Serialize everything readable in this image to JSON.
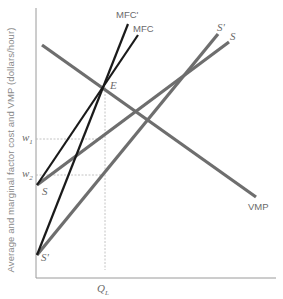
{
  "diagram": {
    "title": "",
    "y_axis_label": "Average and marginal factor cost and VMP (dollars/hour)",
    "x_axis_label": "",
    "x_ticks": [
      {
        "label": "Q",
        "subscript": "L"
      }
    ],
    "y_ticks": [
      {
        "label": "w",
        "subscript": "1"
      },
      {
        "label": "w",
        "subscript": "2"
      }
    ],
    "curves": [
      {
        "name": "VMP",
        "label": "VMP",
        "color": "#6e6e6e",
        "from": [
          42,
          45
        ],
        "to": [
          256,
          197
        ]
      },
      {
        "name": "S",
        "label": "S",
        "start_label": "S",
        "color": "#6e6e6e",
        "from": [
          37,
          185
        ],
        "to": [
          229,
          42
        ]
      },
      {
        "name": "S'",
        "label": "S'",
        "start_label": "S'",
        "color": "#6e6e6e",
        "from": [
          37,
          255
        ],
        "to": [
          218,
          34
        ]
      },
      {
        "name": "MFC",
        "label": "MFC",
        "color": "#1a1a1a",
        "from": [
          37,
          185
        ],
        "to": [
          138,
          35
        ]
      },
      {
        "name": "MFC'",
        "label": "MFC'",
        "color": "#1a1a1a",
        "from": [
          37,
          255
        ],
        "to": [
          128,
          24
        ]
      }
    ],
    "points": [
      {
        "label": "E",
        "at": [
          103,
          87
        ]
      }
    ],
    "guides": {
      "w1_y": 139,
      "w2_y": 175,
      "QL_x": 105
    },
    "colors": {
      "supply_vmp": "#6e6e6e",
      "mfc": "#1a1a1a",
      "axis": "#9a9a9a",
      "guide": "#b5b5b5"
    }
  },
  "labels": {
    "mfc_prime": "MFC'",
    "mfc": "MFC",
    "s_prime_top": "S'",
    "s_top": "S",
    "e": "E",
    "vmp": "VMP",
    "w1_base": "w",
    "w1_sub": "1",
    "w2_base": "w",
    "w2_sub": "2",
    "s_start": "S",
    "s_prime_start": "S'",
    "ql_base": "Q",
    "ql_sub": "L"
  }
}
